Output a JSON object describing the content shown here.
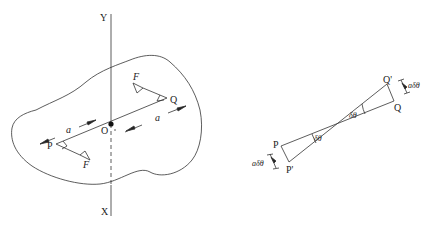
{
  "left_figure": {
    "axis_top_label": "Y",
    "axis_bottom_label": "X",
    "origin_label": "O",
    "point_p_label": "P",
    "point_q_label": "Q",
    "force_label_top": "F",
    "force_label_bottom": "F",
    "distance_label_left": "a",
    "distance_label_right": "a"
  },
  "right_figure": {
    "point_p_label": "P",
    "point_p_prime_label": "P'",
    "point_q_label": "Q",
    "point_q_prime_label": "Q'",
    "angle_label_left": "δθ",
    "angle_label_right": "δθ",
    "angle_label_center": "δθ",
    "arc_label_left": "aδθ",
    "arc_label_right": "aδθ"
  },
  "colors": {
    "line": "#333333",
    "background": "#ffffff"
  }
}
